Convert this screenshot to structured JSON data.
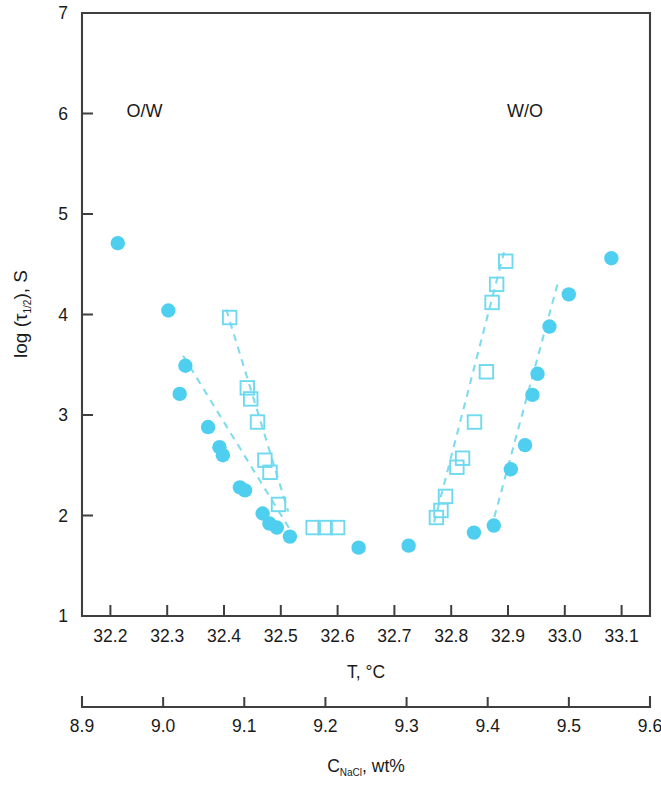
{
  "chart_data": {
    "type": "scatter",
    "title": "",
    "xlabel": "T, °C",
    "ylabel": "log (τ₁/₂), S",
    "secondary_xlabel": "C_NaCl, wt%",
    "xlim": [
      32.15,
      33.15
    ],
    "ylim": [
      1,
      7
    ],
    "secondary_xlim": [
      8.9,
      9.6
    ],
    "grid": false,
    "legend": "none",
    "xticks": [
      "32.2",
      "32.3",
      "32.4",
      "32.5",
      "32.6",
      "32.7",
      "32.8",
      "32.9",
      "33.0",
      "33.1"
    ],
    "xtick_values": [
      32.2,
      32.3,
      32.4,
      32.5,
      32.6,
      32.7,
      32.8,
      32.9,
      33.0,
      33.1
    ],
    "yticks": [
      "1",
      "2",
      "3",
      "4",
      "5",
      "6",
      "7"
    ],
    "ytick_values": [
      1,
      2,
      3,
      4,
      5,
      6,
      7
    ],
    "secondary_xticks": [
      "8.9",
      "9.0",
      "9.1",
      "9.2",
      "9.3",
      "9.4",
      "9.5",
      "9.6"
    ],
    "secondary_xtick_values": [
      8.9,
      9.0,
      9.1,
      9.2,
      9.3,
      9.4,
      9.5,
      9.6
    ],
    "annotations": [
      {
        "text": "O/W",
        "x": 32.26,
        "y": 5.97
      },
      {
        "text": "W/O",
        "x": 32.93,
        "y": 5.97
      }
    ],
    "marker_color": "#4ecff0",
    "open_marker_color": "#6fd9ef",
    "fit_line_color": "#7fdcee",
    "axis_color": "#3f3f3f",
    "series": [
      {
        "name": "filled-circles",
        "marker": "filled-circle",
        "points": [
          {
            "x": 32.213,
            "y": 4.71
          },
          {
            "x": 32.302,
            "y": 4.04
          },
          {
            "x": 32.332,
            "y": 3.49
          },
          {
            "x": 32.322,
            "y": 3.21
          },
          {
            "x": 32.372,
            "y": 2.88
          },
          {
            "x": 32.392,
            "y": 2.68
          },
          {
            "x": 32.398,
            "y": 2.6
          },
          {
            "x": 32.428,
            "y": 2.28
          },
          {
            "x": 32.437,
            "y": 2.25
          },
          {
            "x": 32.468,
            "y": 2.02
          },
          {
            "x": 32.48,
            "y": 1.92
          },
          {
            "x": 32.493,
            "y": 1.88
          },
          {
            "x": 32.516,
            "y": 1.79
          },
          {
            "x": 32.637,
            "y": 1.68
          },
          {
            "x": 32.725,
            "y": 1.7
          },
          {
            "x": 32.84,
            "y": 1.83
          },
          {
            "x": 32.875,
            "y": 1.9
          },
          {
            "x": 32.905,
            "y": 2.46
          },
          {
            "x": 32.93,
            "y": 2.7
          },
          {
            "x": 32.943,
            "y": 3.2
          },
          {
            "x": 32.952,
            "y": 3.41
          },
          {
            "x": 32.973,
            "y": 3.88
          },
          {
            "x": 33.007,
            "y": 4.2
          },
          {
            "x": 33.082,
            "y": 4.56
          }
        ]
      },
      {
        "name": "open-squares",
        "marker": "open-square",
        "points": [
          {
            "x": 32.41,
            "y": 3.97
          },
          {
            "x": 32.441,
            "y": 3.27
          },
          {
            "x": 32.447,
            "y": 3.16
          },
          {
            "x": 32.459,
            "y": 2.93
          },
          {
            "x": 32.472,
            "y": 2.55
          },
          {
            "x": 32.481,
            "y": 2.43
          },
          {
            "x": 32.496,
            "y": 2.11
          },
          {
            "x": 32.557,
            "y": 1.88
          },
          {
            "x": 32.578,
            "y": 1.88
          },
          {
            "x": 32.6,
            "y": 1.88
          },
          {
            "x": 32.774,
            "y": 1.98
          },
          {
            "x": 32.782,
            "y": 2.05
          },
          {
            "x": 32.79,
            "y": 2.19
          },
          {
            "x": 32.81,
            "y": 2.48
          },
          {
            "x": 32.82,
            "y": 2.57
          },
          {
            "x": 32.841,
            "y": 2.93
          },
          {
            "x": 32.862,
            "y": 3.43
          },
          {
            "x": 32.872,
            "y": 4.12
          },
          {
            "x": 32.88,
            "y": 4.3
          },
          {
            "x": 32.896,
            "y": 4.53
          }
        ]
      }
    ],
    "fit_lines": [
      {
        "name": "ow-circle-fit",
        "x1": 32.328,
        "y1": 3.59,
        "x2": 32.527,
        "y2": 1.76
      },
      {
        "name": "ow-square-fit",
        "x1": 32.404,
        "y1": 4.05,
        "x2": 32.513,
        "y2": 2.04
      },
      {
        "name": "wo-square-fit",
        "x1": 32.77,
        "y1": 1.93,
        "x2": 32.893,
        "y2": 4.62
      },
      {
        "name": "wo-circle-fit",
        "x1": 32.87,
        "y1": 1.86,
        "x2": 32.988,
        "y2": 4.32
      }
    ]
  },
  "labels": {
    "y_axis_prefix": "log (",
    "y_axis_tau": "τ",
    "y_axis_sub": "1/2",
    "y_axis_suffix": "), S",
    "x_axis_title": "T, °C",
    "secondary_axis_main": "C",
    "secondary_axis_sub": "NaCl",
    "secondary_axis_rest": ", wt%",
    "ow": "O/W",
    "wo": "W/O"
  }
}
